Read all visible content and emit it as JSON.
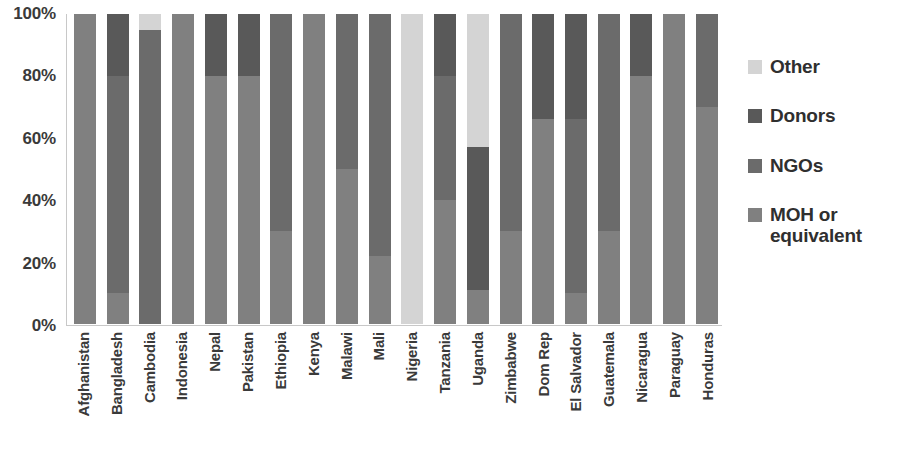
{
  "chart_data": {
    "type": "bar",
    "subtype": "stacked-100-percent",
    "title": "",
    "xlabel": "",
    "ylabel": "",
    "ylim": [
      0,
      100
    ],
    "yticks": [
      "0%",
      "20%",
      "40%",
      "60%",
      "80%",
      "100%"
    ],
    "grid": false,
    "legend_position": "right",
    "categories": [
      "Afghanistan",
      "Bangladesh",
      "Cambodia",
      "Indonesia",
      "Nepal",
      "Pakistan",
      "Ethiopia",
      "Kenya",
      "Malawi",
      "Mali",
      "Nigeria",
      "Tanzania",
      "Uganda",
      "Zimbabwe",
      "Dom Rep",
      "El Salvador",
      "Guatemala",
      "Nicaragua",
      "Paraguay",
      "Honduras"
    ],
    "series": [
      {
        "name": "MOH or equivalent",
        "color": "#808080",
        "values": [
          100,
          10,
          0,
          100,
          80,
          80,
          30,
          100,
          50,
          22,
          0,
          40,
          11,
          30,
          66,
          10,
          30,
          80,
          100,
          70
        ]
      },
      {
        "name": "NGOs",
        "color": "#6b6b6b",
        "values": [
          0,
          70,
          95,
          0,
          0,
          0,
          70,
          0,
          50,
          78,
          0,
          40,
          0,
          70,
          0,
          56,
          70,
          0,
          0,
          30
        ]
      },
      {
        "name": "Donors",
        "color": "#595959",
        "values": [
          0,
          20,
          0,
          0,
          20,
          20,
          0,
          0,
          0,
          0,
          0,
          20,
          46,
          0,
          34,
          34,
          0,
          20,
          0,
          0
        ]
      },
      {
        "name": "Other",
        "color": "#d4d4d4",
        "values": [
          0,
          0,
          5,
          0,
          0,
          0,
          0,
          0,
          0,
          0,
          100,
          0,
          43,
          0,
          0,
          0,
          0,
          0,
          0,
          0
        ]
      }
    ]
  },
  "yaxis": {
    "ticks": [
      {
        "label": "100%",
        "value": 100
      },
      {
        "label": "80%",
        "value": 80
      },
      {
        "label": "60%",
        "value": 60
      },
      {
        "label": "40%",
        "value": 40
      },
      {
        "label": "20%",
        "value": 20
      },
      {
        "label": "0%",
        "value": 0
      }
    ]
  },
  "legend": {
    "items": [
      {
        "label": "Other",
        "color": "#d4d4d4"
      },
      {
        "label": "Donors",
        "color": "#595959"
      },
      {
        "label": "NGOs",
        "color": "#6b6b6b"
      },
      {
        "label": "MOH or equivalent",
        "color": "#808080"
      }
    ]
  },
  "colors": {
    "axis_line": "#c8c8c8",
    "text": "#3a3a3a",
    "background": "#ffffff"
  }
}
